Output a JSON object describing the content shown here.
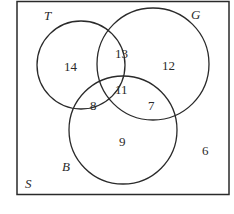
{
  "diagram": {
    "type": "venn-3",
    "universe_label": "S",
    "sets": [
      {
        "label": "T",
        "circle": {
          "cx": 81,
          "cy": 65,
          "r": 45
        }
      },
      {
        "label": "G",
        "circle": {
          "cx": 152,
          "cy": 65,
          "r": 57
        }
      },
      {
        "label": "B",
        "circle": {
          "cx": 123,
          "cy": 130,
          "r": 54
        }
      }
    ],
    "regions": {
      "T_only": "14",
      "G_only": "12",
      "B_only": "9",
      "T_and_G_only": "13",
      "T_and_B_only": "8",
      "G_and_B_only": "7",
      "T_G_B": "11",
      "outside": "6"
    },
    "colors": {
      "stroke": "#2a2a2a",
      "background": "#ffffff"
    }
  }
}
